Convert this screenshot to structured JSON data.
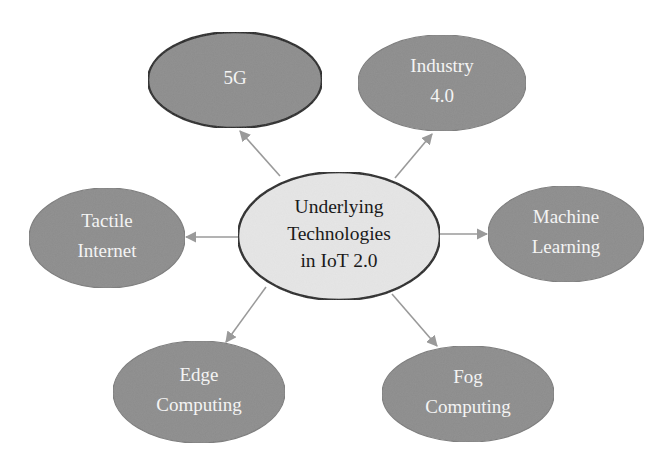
{
  "diagram": {
    "type": "mind-map",
    "colors": {
      "background": "#ffffff",
      "center_fill": "#e6e6e6",
      "center_stroke": "#1e1e1e",
      "outer_fill": "#8c8c8c",
      "outer_stroke": "#7a7a7a",
      "highlight_stroke": "#1e1e1e",
      "outer_text": "#f4f4f4",
      "center_text": "#1a1a1a",
      "arrow": "#9a9a9a"
    },
    "center": {
      "id": "center",
      "lines": [
        "Underlying",
        "Technologies",
        "in IoT 2.0"
      ],
      "cx": 339,
      "cy": 236,
      "rx": 101,
      "ry": 64
    },
    "nodes": [
      {
        "id": "5g",
        "lines": [
          "5G"
        ],
        "cx": 235,
        "cy": 80,
        "rx": 87,
        "ry": 48,
        "highlighted": true,
        "arrow": {
          "x1": 280,
          "y1": 176,
          "x2": 240,
          "y2": 131
        }
      },
      {
        "id": "industry-4-0",
        "lines": [
          "Industry",
          "4.0"
        ],
        "cx": 442,
        "cy": 83,
        "rx": 84,
        "ry": 48,
        "highlighted": false,
        "arrow": {
          "x1": 395,
          "y1": 178,
          "x2": 432,
          "y2": 134
        }
      },
      {
        "id": "tactile-internet",
        "lines": [
          "Tactile",
          "Internet"
        ],
        "cx": 107,
        "cy": 238,
        "rx": 78,
        "ry": 50,
        "highlighted": false,
        "arrow": {
          "x1": 238,
          "y1": 237,
          "x2": 186,
          "y2": 237
        }
      },
      {
        "id": "machine-learning",
        "lines": [
          "Machine",
          "Learning"
        ],
        "cx": 566,
        "cy": 234,
        "rx": 78,
        "ry": 48,
        "highlighted": false,
        "arrow": {
          "x1": 440,
          "y1": 234,
          "x2": 487,
          "y2": 234
        }
      },
      {
        "id": "edge-computing",
        "lines": [
          "Edge",
          "Computing"
        ],
        "cx": 199,
        "cy": 392,
        "rx": 86,
        "ry": 51,
        "highlighted": false,
        "arrow": {
          "x1": 266,
          "y1": 287,
          "x2": 226,
          "y2": 342
        }
      },
      {
        "id": "fog-computing",
        "lines": [
          "Fog",
          "Computing"
        ],
        "cx": 468,
        "cy": 394,
        "rx": 86,
        "ry": 48,
        "highlighted": false,
        "arrow": {
          "x1": 392,
          "y1": 294,
          "x2": 437,
          "y2": 346
        }
      }
    ]
  }
}
